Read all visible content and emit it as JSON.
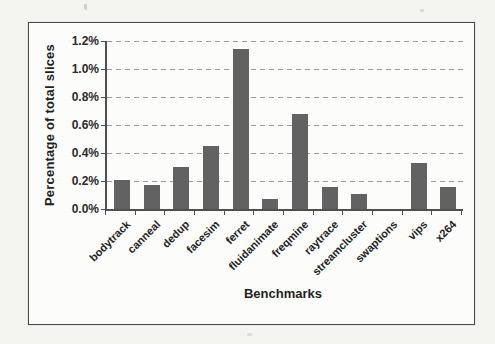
{
  "chart_data": {
    "type": "bar",
    "title": "",
    "xlabel": "Benchmarks",
    "ylabel": "Percentage of total slices",
    "categories": [
      "bodytrack",
      "canneal",
      "dedup",
      "facesim",
      "ferret",
      "fluidanimate",
      "freqmine",
      "raytrace",
      "streamcluster",
      "swaptions",
      "vips",
      "x264"
    ],
    "values": [
      0.21,
      0.17,
      0.3,
      0.45,
      1.14,
      0.07,
      0.68,
      0.16,
      0.11,
      0.0,
      0.33,
      0.16
    ],
    "value_unit": "%",
    "ylim": [
      0,
      1.2
    ],
    "yticks": [
      0,
      0.2,
      0.4,
      0.6,
      0.8,
      1.0,
      1.2
    ],
    "ytick_labels": [
      "0.0%",
      "0.2%",
      "0.4%",
      "0.6%",
      "0.8%",
      "1.0%",
      "1.2%"
    ],
    "grid": "horizontal-dashed",
    "legend": "none",
    "bar_color": "#626262"
  }
}
